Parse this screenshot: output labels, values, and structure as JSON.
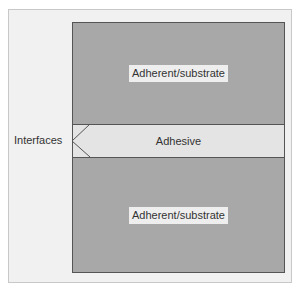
{
  "diagram": {
    "layers": [
      {
        "id": "top-substrate",
        "label": "Adherent/substrate"
      },
      {
        "id": "adhesive",
        "label": "Adhesive"
      },
      {
        "id": "bottom-substrate",
        "label": "Adherent/substrate"
      }
    ],
    "callout": {
      "label": "Interfaces"
    },
    "colors": {
      "substrate": "#a8a8a8",
      "adhesive": "#e4e4e4",
      "frame": "#f1f1f1",
      "border": "#555555"
    }
  }
}
